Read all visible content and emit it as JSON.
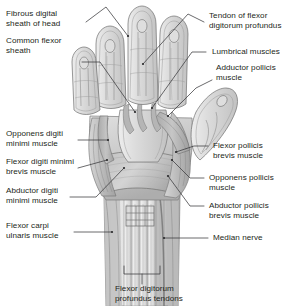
{
  "figure": {
    "style": "grayscale-medical-illustration",
    "colors": {
      "background": "#ffffff",
      "ink": "#231f20",
      "leader_line": "#3a3a3c",
      "tissue_light": "#e8e8e8",
      "tissue_mid": "#c9c9c9",
      "tissue_dark": "#9a9a9a",
      "outline": "#6f6f6f",
      "tendon": "#f2f2f2"
    }
  },
  "labels": {
    "left": [
      {
        "id": "fibrous-digital-sheath",
        "text": "Fibrous digital\nsheath of head"
      },
      {
        "id": "common-flexor-sheath",
        "text": "Common flexor\nsheath"
      },
      {
        "id": "opponens-digiti-minimi",
        "text": "Opponens digiti\nminimi muscle"
      },
      {
        "id": "flexor-digiti-minimi-brevis",
        "text": "Flexor digiti minimi\nbrevis muscle"
      },
      {
        "id": "abductor-digiti-minimi",
        "text": "Abductor digiti\nminimi muscle"
      },
      {
        "id": "flexor-carpi-ulnaris",
        "text": "Flexor carpi\nulnaris muscle"
      }
    ],
    "right": [
      {
        "id": "tendon-flexor-digitorum-profundus",
        "text": "Tendon of flexor\ndigitorum profundus"
      },
      {
        "id": "lumbrical-muscles",
        "text": "Lumbrical muscles"
      },
      {
        "id": "adductor-pollicis",
        "text": "Adductor pollicis\nmuscle"
      },
      {
        "id": "flexor-pollicis-brevis",
        "text": "Flexor pollicis\nbrevis muscle"
      },
      {
        "id": "opponens-pollicis",
        "text": "Opponens pollicis\nmuscle"
      },
      {
        "id": "abductor-pollicis-brevis",
        "text": "Abductor pollicis\nbrevis muscle"
      },
      {
        "id": "median-nerve",
        "text": "Median nerve"
      }
    ],
    "bottom": [
      {
        "id": "flexor-digitorum-profundus-tendons",
        "text": "Flexor digitorum\nprofundus tendons"
      }
    ]
  }
}
